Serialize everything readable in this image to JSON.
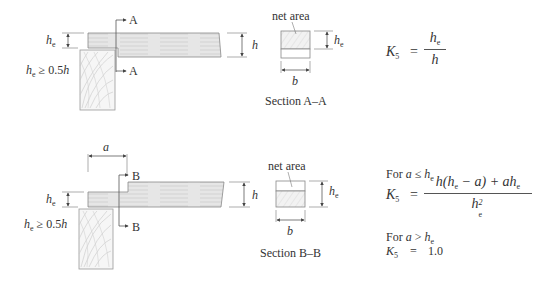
{
  "diagram_top": {
    "section_marker_top": "A",
    "section_marker_bottom": "A",
    "dim_he": "h",
    "dim_he_sub": "e",
    "dim_h": "h",
    "condition_var": "h",
    "condition_sub": "e",
    "condition_text": " ≥ 0.5",
    "condition_h": "h",
    "section": {
      "net_area_label": "net area",
      "dim_he": "h",
      "dim_he_sub": "e",
      "dim_b": "b",
      "caption": "Section A–A"
    },
    "formula": {
      "lhs": "K",
      "lhs_sub": "5",
      "equals": "=",
      "numerator": "h",
      "numerator_sub": "e",
      "denominator": "h"
    }
  },
  "diagram_bottom": {
    "dim_a": "a",
    "section_marker_top": "B",
    "section_marker_bottom": "B",
    "dim_he": "h",
    "dim_he_sub": "e",
    "dim_h": "h",
    "condition_var": "h",
    "condition_sub": "e",
    "condition_text": " ≥ 0.5",
    "condition_h": "h",
    "section": {
      "net_area_label": "net area",
      "dim_he": "h",
      "dim_he_sub": "e",
      "dim_b": "b",
      "caption": "Section B–B"
    },
    "formula": {
      "case1_label": "For ",
      "case1_cond_var": "a",
      "case1_cond_op": " ≤ ",
      "case1_cond_h": "h",
      "case1_cond_sub": "e",
      "lhs": "K",
      "lhs_sub": "5",
      "equals": "=",
      "numerator_text": "h(h",
      "numerator_sub1": "e",
      "numerator_mid": " − a) + ah",
      "numerator_sub2": "e",
      "denominator": "h",
      "denominator_sub": "e",
      "denominator_sup": "2",
      "case2_label": "For ",
      "case2_cond_var": "a",
      "case2_cond_op": " > ",
      "case2_cond_h": "h",
      "case2_cond_sub": "e",
      "case2_lhs": "K",
      "case2_lhs_sub": "5",
      "case2_equals": "=",
      "case2_value": "1.0"
    }
  }
}
